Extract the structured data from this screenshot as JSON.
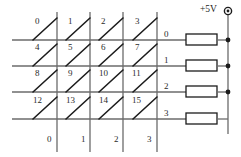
{
  "diagram": {
    "supply_label": "+5V",
    "colors": {
      "wire": "#6b6b6b",
      "ink": "#1c1c1c",
      "background": "#ffffff"
    },
    "keys": [
      {
        "label": "0",
        "row": 0,
        "col": 0
      },
      {
        "label": "1",
        "row": 0,
        "col": 1
      },
      {
        "label": "2",
        "row": 0,
        "col": 2
      },
      {
        "label": "3",
        "row": 0,
        "col": 3
      },
      {
        "label": "4",
        "row": 1,
        "col": 0
      },
      {
        "label": "5",
        "row": 1,
        "col": 1
      },
      {
        "label": "6",
        "row": 1,
        "col": 2
      },
      {
        "label": "7",
        "row": 1,
        "col": 3
      },
      {
        "label": "8",
        "row": 2,
        "col": 0
      },
      {
        "label": "9",
        "row": 2,
        "col": 1
      },
      {
        "label": "10",
        "row": 2,
        "col": 2
      },
      {
        "label": "11",
        "row": 2,
        "col": 3
      },
      {
        "label": "12",
        "row": 3,
        "col": 0
      },
      {
        "label": "13",
        "row": 3,
        "col": 1
      },
      {
        "label": "14",
        "row": 3,
        "col": 2
      },
      {
        "label": "15",
        "row": 3,
        "col": 3
      }
    ],
    "row_labels": [
      "0",
      "1",
      "2",
      "3"
    ],
    "column_labels": [
      "0",
      "1",
      "2",
      "3"
    ],
    "resistors": [
      {
        "row": 0
      },
      {
        "row": 1
      },
      {
        "row": 2
      },
      {
        "row": 3
      }
    ],
    "junction_dots": 3
  }
}
